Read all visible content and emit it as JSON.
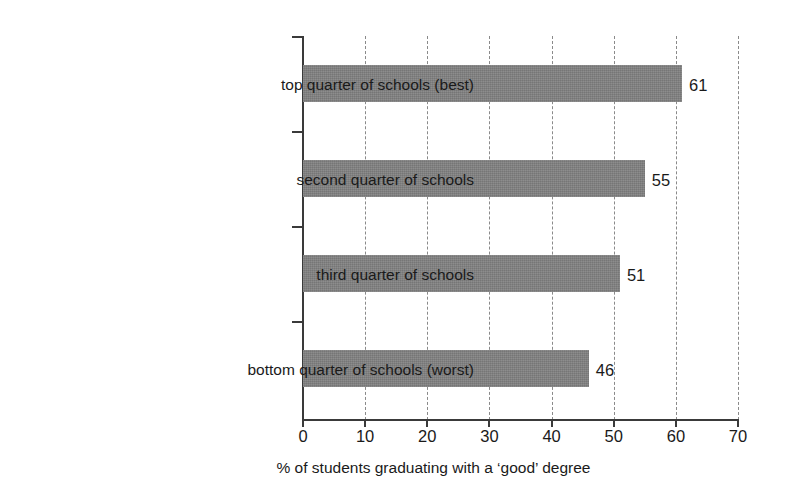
{
  "chart_data": {
    "type": "bar",
    "orientation": "horizontal",
    "title": "",
    "subtitle": "",
    "xlabel": "% of students graduating with a ‘good’ degree",
    "ylabel": "",
    "xlim": [
      0,
      70
    ],
    "xticks": [
      0,
      10,
      20,
      30,
      40,
      50,
      60,
      70
    ],
    "xtick_labels": [
      "0",
      "10",
      "20",
      "30",
      "40",
      "50",
      "60",
      "70"
    ],
    "grid": "vertical-dashed",
    "legend": "none",
    "categories": [
      "top quarter of schools (best)",
      "second quarter of schools",
      "third quarter of schools",
      "bottom quarter of schools (worst)"
    ],
    "values": [
      61,
      55,
      51,
      46
    ],
    "value_labels": [
      "61",
      "55",
      "51",
      "46"
    ],
    "bar_color": "#808080",
    "axis_color": "#3a3a3a",
    "gridline_color": "#8a8a8a",
    "background_color": "#ffffff"
  },
  "bars": [
    {
      "category": "top quarter of schools (best)",
      "value": 61,
      "label": "61"
    },
    {
      "category": "second quarter of schools",
      "value": 55,
      "label": "55"
    },
    {
      "category": "third quarter of schools",
      "value": 51,
      "label": "51"
    },
    {
      "category": "bottom quarter of schools (worst)",
      "value": 46,
      "label": "46"
    }
  ]
}
